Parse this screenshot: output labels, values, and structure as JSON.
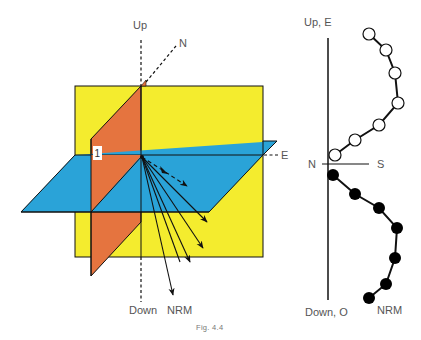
{
  "figure": {
    "caption": "Fig. 4.4",
    "colors": {
      "yellow_plane": "#f4ec2e",
      "blue_plane": "#2aa3d8",
      "orange_plane": "#e5743f",
      "stroke": "#111111",
      "label": "#555555",
      "open_marker": "#ffffff",
      "filled_marker": "#000000"
    },
    "left_panel": {
      "axis_up_label": "Up",
      "axis_down_label": "Down",
      "axis_north_label": "N",
      "axis_east_label": "E",
      "plane_label": "1",
      "vector_label": "NRM",
      "vector_count": 5,
      "dashed_vector": "horizontal projection"
    },
    "right_panel": {
      "top_label": "Up, E",
      "bottom_label": "Down, O",
      "left_label": "N",
      "right_label": "S",
      "series_label": "NRM",
      "open_circles": [
        [
          369,
          34
        ],
        [
          386,
          50
        ],
        [
          395,
          73
        ],
        [
          398,
          103
        ],
        [
          379,
          125
        ],
        [
          355,
          140
        ],
        [
          335,
          155
        ]
      ],
      "filled_circles": [
        [
          333,
          175
        ],
        [
          355,
          194
        ],
        [
          379,
          208
        ],
        [
          397,
          228
        ],
        [
          395,
          258
        ],
        [
          386,
          284
        ],
        [
          369,
          298
        ]
      ]
    }
  }
}
